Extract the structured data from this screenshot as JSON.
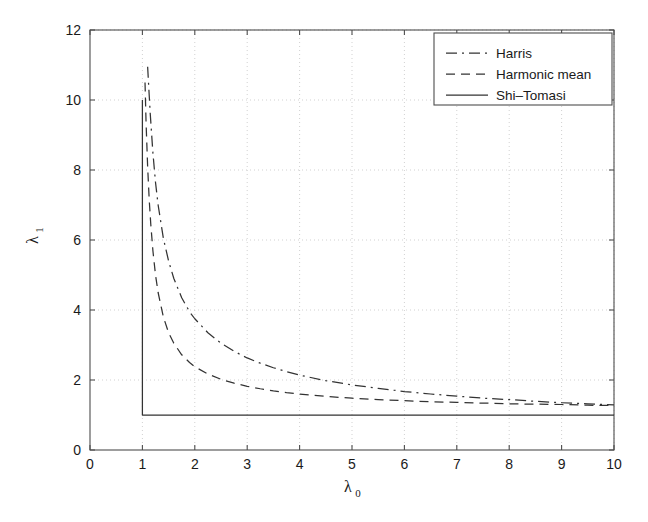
{
  "chart_data": {
    "type": "line",
    "title": "",
    "subtitle": "",
    "xlabel": "λ",
    "xlabel_sub": "0",
    "ylabel": "λ",
    "ylabel_sub": "1",
    "xlim": [
      0,
      10
    ],
    "ylim": [
      0,
      12
    ],
    "xticks": [
      0,
      1,
      2,
      3,
      4,
      5,
      6,
      7,
      8,
      9,
      10
    ],
    "yticks": [
      0,
      2,
      4,
      6,
      8,
      10,
      12
    ],
    "xtick_labels": [
      "0",
      "1",
      "2",
      "3",
      "4",
      "5",
      "6",
      "7",
      "8",
      "9",
      "10"
    ],
    "ytick_labels": [
      "0",
      "2",
      "4",
      "6",
      "8",
      "10",
      "12"
    ],
    "grid": true,
    "grid_style": "dotted",
    "grid_color": "#cccccc",
    "legend_position": "top-right",
    "legend_entries": [
      "Harris",
      "Harmonic mean",
      "Shi–Tomasi"
    ],
    "series": [
      {
        "name": "Harris",
        "style": "dashdot",
        "color": "#333333",
        "x": [
          1.1,
          1.12,
          1.15,
          1.2,
          1.25,
          1.3,
          1.4,
          1.5,
          1.6,
          1.75,
          1.9,
          2.0,
          2.25,
          2.5,
          2.75,
          3.0,
          3.25,
          3.5,
          3.75,
          4.0,
          4.5,
          5.0,
          5.5,
          6.0,
          6.5,
          7.0,
          7.5,
          8.0,
          8.5,
          9.0,
          9.5,
          10.0
        ],
        "y": [
          10.95,
          10.4,
          9.6,
          8.5,
          7.65,
          7.0,
          6.05,
          5.4,
          4.9,
          4.35,
          3.95,
          3.75,
          3.35,
          3.05,
          2.82,
          2.63,
          2.48,
          2.35,
          2.24,
          2.14,
          1.98,
          1.86,
          1.76,
          1.67,
          1.6,
          1.54,
          1.48,
          1.44,
          1.39,
          1.35,
          1.32,
          1.29
        ]
      },
      {
        "name": "Harmonic mean",
        "style": "dashed",
        "color": "#333333",
        "x": [
          1.05,
          1.07,
          1.1,
          1.13,
          1.16,
          1.2,
          1.25,
          1.3,
          1.4,
          1.5,
          1.6,
          1.75,
          1.9,
          2.0,
          2.25,
          2.5,
          2.75,
          3.0,
          3.25,
          3.5,
          3.75,
          4.0,
          4.5,
          5.0,
          5.5,
          6.0,
          6.5,
          7.0,
          7.5,
          8.0,
          8.5,
          9.0,
          9.5,
          10.0
        ],
        "y": [
          10.5,
          9.35,
          8.1,
          7.15,
          6.45,
          5.7,
          5.0,
          4.5,
          3.8,
          3.35,
          3.05,
          2.72,
          2.5,
          2.38,
          2.17,
          2.02,
          1.91,
          1.82,
          1.75,
          1.69,
          1.64,
          1.6,
          1.53,
          1.48,
          1.44,
          1.41,
          1.38,
          1.36,
          1.34,
          1.32,
          1.31,
          1.3,
          1.28,
          1.27
        ]
      },
      {
        "name": "Shi–Tomasi",
        "style": "solid",
        "color": "#333333",
        "x": [
          1.0,
          1.0,
          1.0,
          10.0
        ],
        "y": [
          10.0,
          4.0,
          1.0,
          1.0
        ]
      }
    ],
    "annotations": []
  }
}
